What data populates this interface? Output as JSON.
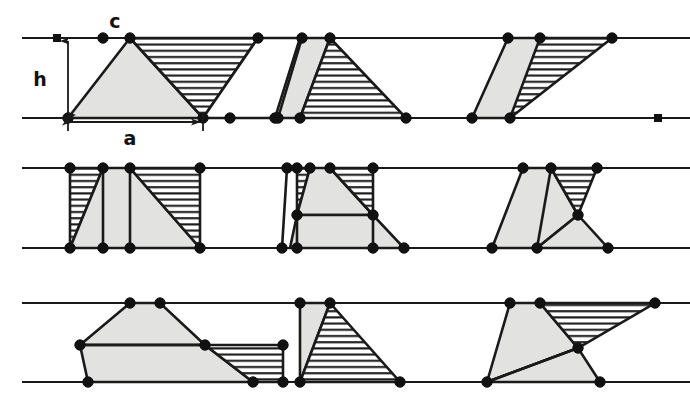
{
  "figure": {
    "background_color": "#ffffff",
    "ink_color": "#1a1a1a",
    "fill_grey": "#e2e2e0",
    "fill_white": "#ffffff",
    "hatch_color": "#1a1a1a",
    "labels": [
      {
        "id": "label-h",
        "text": "h",
        "x": 40,
        "y": 86,
        "meaning": "height between the two parallel rails"
      },
      {
        "id": "label-c",
        "text": "c",
        "x": 115,
        "y": 28,
        "meaning": "apex vertex of the first triangle"
      },
      {
        "id": "label-a",
        "text": "a",
        "x": 130,
        "y": 145,
        "meaning": "base length of the first triangle"
      }
    ],
    "dimensions": {
      "h_arrow": {
        "x": 68,
        "y_top": 38,
        "y_bottom": 118
      },
      "a_arrow": {
        "y": 122,
        "x_left": 68,
        "x_right": 203
      }
    },
    "rails": [
      {
        "id": "row-1-top",
        "y": 38,
        "x1": 22,
        "x2": 690
      },
      {
        "id": "row-1-bottom",
        "y": 118,
        "x1": 22,
        "x2": 690
      },
      {
        "id": "row-2-top",
        "y": 168,
        "x1": 22,
        "x2": 690
      },
      {
        "id": "row-2-bottom",
        "y": 248,
        "x1": 22,
        "x2": 690
      },
      {
        "id": "row-3-top",
        "y": 303,
        "x1": 22,
        "x2": 690
      },
      {
        "id": "row-3-bottom",
        "y": 382,
        "x1": 22,
        "x2": 690
      }
    ],
    "square_markers": [
      {
        "id": "sq-row1-top-left",
        "x": 57,
        "y": 38
      },
      {
        "id": "sq-row1-bottom-right",
        "x": 658,
        "y": 118
      }
    ],
    "rows": [
      {
        "id": "row-1",
        "top": 38,
        "bottom": 118,
        "panels": [
          {
            "id": "panel-1-left",
            "shapes": [
              {
                "id": "p1-grey-triangle",
                "style": "grey",
                "points": "68,118 130,38 203,118"
              },
              {
                "id": "p1-hatched-parallelogram",
                "style": "hatch",
                "points": "130,38 258,38 203,118"
              },
              {
                "id": "p1-white-parallelogram",
                "style": "white",
                "points": "258,38 203,118 275,118 300,38"
              }
            ],
            "vertices": [
              {
                "x": 68,
                "y": 118
              },
              {
                "x": 103,
                "y": 38
              },
              {
                "x": 130,
                "y": 38
              },
              {
                "x": 203,
                "y": 118
              },
              {
                "x": 258,
                "y": 38
              },
              {
                "x": 230,
                "y": 118
              },
              {
                "x": 275,
                "y": 118
              }
            ]
          },
          {
            "id": "panel-1-middle",
            "shapes": [
              {
                "id": "p1m-grey-sliver",
                "style": "grey",
                "points": "302,38 330,38 300,118 278,118"
              },
              {
                "id": "p1m-hatched-triangle",
                "style": "hatch",
                "points": "330,38 406,118 300,118"
              }
            ],
            "vertices": [
              {
                "x": 278,
                "y": 118
              },
              {
                "x": 302,
                "y": 38
              },
              {
                "x": 330,
                "y": 38
              },
              {
                "x": 300,
                "y": 118
              },
              {
                "x": 406,
                "y": 118
              }
            ]
          },
          {
            "id": "panel-1-right",
            "shapes": [
              {
                "id": "p1r-grey-triangle",
                "style": "grey",
                "points": "472,118 508,38 540,38 540,38 546,38 510,118"
              },
              {
                "id": "p1r-hatched-triangle",
                "style": "hatch",
                "points": "540,38 612,38 510,118"
              }
            ],
            "vertices": [
              {
                "x": 472,
                "y": 118
              },
              {
                "x": 508,
                "y": 38
              },
              {
                "x": 540,
                "y": 38
              },
              {
                "x": 612,
                "y": 38
              },
              {
                "x": 510,
                "y": 118
              }
            ]
          }
        ]
      },
      {
        "id": "row-2",
        "top": 168,
        "bottom": 248,
        "panels": [
          {
            "id": "panel-2-left",
            "shapes": [
              {
                "id": "p2l-hatch-left",
                "style": "hatch",
                "points": "70,168 103,168 70,248"
              },
              {
                "id": "p2l-grey-body",
                "style": "grey",
                "points": "103,168 130,168 200,248 70,248"
              },
              {
                "id": "p2l-hatch-right",
                "style": "hatch",
                "points": "130,168 200,168 200,248"
              }
            ],
            "vertices": [
              {
                "x": 70,
                "y": 168
              },
              {
                "x": 103,
                "y": 168
              },
              {
                "x": 130,
                "y": 168
              },
              {
                "x": 200,
                "y": 168
              },
              {
                "x": 70,
                "y": 248
              },
              {
                "x": 103,
                "y": 248
              },
              {
                "x": 130,
                "y": 248
              },
              {
                "x": 200,
                "y": 248
              }
            ],
            "inner_lines": [
              {
                "x1": 103,
                "y1": 168,
                "x2": 103,
                "y2": 248
              },
              {
                "x1": 130,
                "y1": 168,
                "x2": 130,
                "y2": 248
              }
            ]
          },
          {
            "id": "panel-2-middle",
            "shapes": [
              {
                "id": "p2m-hatch-left",
                "style": "hatch",
                "points": "297,168 310,168 297,215"
              },
              {
                "id": "p2m-grey-upper",
                "style": "grey",
                "points": "310,168 330,168 373,215 297,215"
              },
              {
                "id": "p2m-hatch-right",
                "style": "hatch",
                "points": "330,168 373,168 373,215"
              },
              {
                "id": "p2m-grey-lower",
                "style": "grey",
                "points": "297,215 373,215 404,248 290,248"
              }
            ],
            "vertices": [
              {
                "x": 287,
                "y": 168
              },
              {
                "x": 297,
                "y": 168
              },
              {
                "x": 310,
                "y": 168
              },
              {
                "x": 330,
                "y": 168
              },
              {
                "x": 373,
                "y": 168
              },
              {
                "x": 297,
                "y": 215
              },
              {
                "x": 373,
                "y": 215
              },
              {
                "x": 282,
                "y": 248
              },
              {
                "x": 297,
                "y": 248
              },
              {
                "x": 373,
                "y": 248
              },
              {
                "x": 404,
                "y": 248
              }
            ],
            "inner_lines": [
              {
                "x1": 297,
                "y1": 215,
                "x2": 297,
                "y2": 248
              },
              {
                "x1": 373,
                "y1": 215,
                "x2": 373,
                "y2": 248
              },
              {
                "x1": 287,
                "y1": 168,
                "x2": 282,
                "y2": 248
              }
            ]
          },
          {
            "id": "panel-2-right",
            "shapes": [
              {
                "id": "p2r-grey-main",
                "style": "grey",
                "points": "492,248 523,168 551,168 578,215 537,248"
              },
              {
                "id": "p2r-hatch",
                "style": "hatch",
                "points": "551,168 597,168 578,215"
              },
              {
                "id": "p2r-grey-tail",
                "style": "grey",
                "points": "578,215 608,248 537,248"
              }
            ],
            "vertices": [
              {
                "x": 523,
                "y": 168
              },
              {
                "x": 551,
                "y": 168
              },
              {
                "x": 597,
                "y": 168
              },
              {
                "x": 578,
                "y": 215
              },
              {
                "x": 492,
                "y": 248
              },
              {
                "x": 537,
                "y": 248
              },
              {
                "x": 608,
                "y": 248
              }
            ],
            "inner_lines": [
              {
                "x1": 551,
                "y1": 168,
                "x2": 537,
                "y2": 248
              }
            ]
          }
        ]
      },
      {
        "id": "row-3",
        "top": 303,
        "bottom": 382,
        "panels": [
          {
            "id": "panel-3-left",
            "shapes": [
              {
                "id": "p3l-grey-upper",
                "style": "grey",
                "points": "80,345 130,303 160,303 205,345"
              },
              {
                "id": "p3l-grey-lower",
                "style": "grey",
                "points": "80,345 205,345 253,382 88,382"
              },
              {
                "id": "p3l-hatch",
                "style": "hatch",
                "points": "205,345 283,345 283,382 253,382"
              }
            ],
            "vertices": [
              {
                "x": 130,
                "y": 303
              },
              {
                "x": 160,
                "y": 303
              },
              {
                "x": 80,
                "y": 345
              },
              {
                "x": 205,
                "y": 345
              },
              {
                "x": 283,
                "y": 345
              },
              {
                "x": 88,
                "y": 382
              },
              {
                "x": 253,
                "y": 382
              },
              {
                "x": 283,
                "y": 382
              }
            ],
            "inner_lines": [
              {
                "x1": 80,
                "y1": 345,
                "x2": 205,
                "y2": 345
              }
            ]
          },
          {
            "id": "panel-3-middle",
            "shapes": [
              {
                "id": "p3m-grey-wedge",
                "style": "grey",
                "points": "300,303 330,303 300,382"
              },
              {
                "id": "p3m-hatched-triangle",
                "style": "hatch",
                "points": "330,303 400,382 300,382"
              }
            ],
            "vertices": [
              {
                "x": 300,
                "y": 303
              },
              {
                "x": 330,
                "y": 303
              },
              {
                "x": 300,
                "y": 382
              },
              {
                "x": 400,
                "y": 382
              }
            ]
          },
          {
            "id": "panel-3-right",
            "shapes": [
              {
                "id": "p3r-grey-upper",
                "style": "grey",
                "points": "487,382 510,303 540,303 578,348"
              },
              {
                "id": "p3r-hatch",
                "style": "hatch",
                "points": "540,303 655,303 578,348"
              },
              {
                "id": "p3r-grey-lower",
                "style": "grey",
                "points": "487,382 578,348 600,382"
              }
            ],
            "vertices": [
              {
                "x": 510,
                "y": 303
              },
              {
                "x": 540,
                "y": 303
              },
              {
                "x": 655,
                "y": 303
              },
              {
                "x": 578,
                "y": 348
              },
              {
                "x": 487,
                "y": 382
              },
              {
                "x": 600,
                "y": 382
              }
            ],
            "inner_lines": [
              {
                "x1": 487,
                "y1": 382,
                "x2": 578,
                "y2": 348
              }
            ]
          }
        ]
      }
    ]
  }
}
